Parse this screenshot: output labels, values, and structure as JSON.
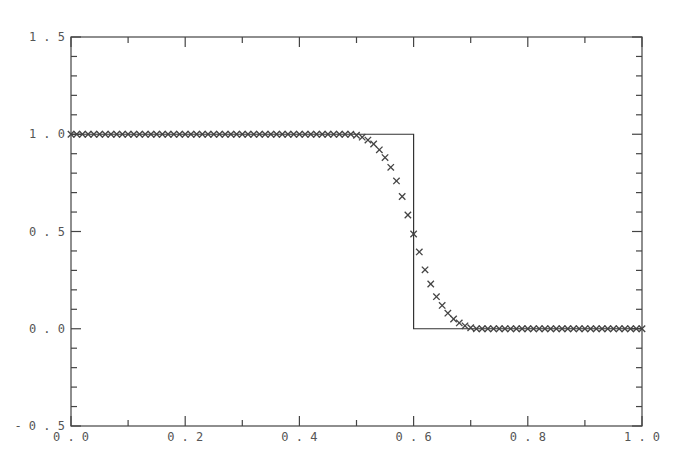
{
  "chart_data": {
    "type": "line",
    "title": "",
    "xlabel": "",
    "ylabel": "",
    "xlim": [
      0.0,
      1.0
    ],
    "ylim": [
      -0.5,
      1.5
    ],
    "grid": false,
    "legend": null,
    "x_ticks": [
      0.0,
      0.2,
      0.4,
      0.6,
      0.8,
      1.0
    ],
    "x_tick_labels": [
      "0.0",
      "0.2",
      "0.4",
      "0.6",
      "0.8",
      "1.0"
    ],
    "x_minor_step": 0.1,
    "y_ticks": [
      -0.5,
      0.0,
      0.5,
      1.0,
      1.5
    ],
    "y_tick_labels": [
      "-0.5",
      "0.0",
      "0.5",
      "1.0",
      "1.5"
    ],
    "y_minor_step": 0.1,
    "series": [
      {
        "name": "exact solution",
        "style": "solid-line",
        "color": "#333333",
        "x": [
          0.0,
          0.6,
          0.6,
          1.0
        ],
        "y": [
          1.0,
          1.0,
          0.0,
          0.0
        ]
      },
      {
        "name": "numerical solution",
        "style": "x-markers",
        "color": "#444444",
        "x_start": 0.0,
        "x_step": 0.01,
        "count": 101,
        "transition": {
          "x": [
            0.5,
            0.51,
            0.52,
            0.53,
            0.54,
            0.55,
            0.56,
            0.57,
            0.58,
            0.59,
            0.6,
            0.61,
            0.62,
            0.63,
            0.64,
            0.65,
            0.66,
            0.67,
            0.68,
            0.69,
            0.7
          ],
          "y": [
            0.995,
            0.985,
            0.97,
            0.95,
            0.92,
            0.88,
            0.83,
            0.76,
            0.68,
            0.585,
            0.487,
            0.395,
            0.303,
            0.23,
            0.165,
            0.12,
            0.08,
            0.05,
            0.03,
            0.015,
            0.005
          ]
        },
        "left_plateau_value": 1.0,
        "right_plateau_value": 0.0
      }
    ]
  }
}
